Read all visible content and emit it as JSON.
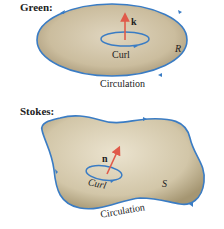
{
  "green": {
    "title": "Green:",
    "vector_label": "k",
    "curl_label": "Curl",
    "region_label": "R",
    "circulation_label": "Circulation"
  },
  "stokes": {
    "title": "Stokes:",
    "vector_label": "n",
    "curl_label": "Curl",
    "surface_label": "S",
    "circulation_label": "Circulation"
  },
  "colors": {
    "boundary": "#3a7cc4",
    "fill": "#c9b99a",
    "vector": "#e05a4a",
    "text": "#222222"
  }
}
